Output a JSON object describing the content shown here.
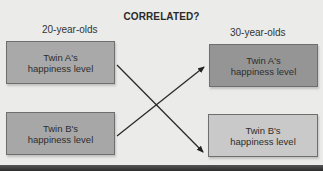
{
  "title": "CORRELATED?",
  "columns": {
    "left": "20-year-olds",
    "right": "30-year-olds"
  },
  "boxes": {
    "a_20": {
      "line1": "Twin A's",
      "line2": "happiness level",
      "color": "#a9a9a9"
    },
    "b_20": {
      "line1": "Twin B's",
      "line2": "happiness level",
      "color": "#a7a7a7"
    },
    "a_30": {
      "line1": "Twin A's",
      "line2": "happiness level",
      "color": "#959595"
    },
    "b_30": {
      "line1": "Twin B's",
      "line2": "happiness level",
      "color": "#c9c9c9"
    }
  },
  "arrows": [
    {
      "from": "Twin A's happiness level (20-year-olds)",
      "to": "Twin B's happiness level (30-year-olds)"
    },
    {
      "from": "Twin B's happiness level (20-year-olds)",
      "to": "Twin A's happiness level (30-year-olds)"
    }
  ]
}
